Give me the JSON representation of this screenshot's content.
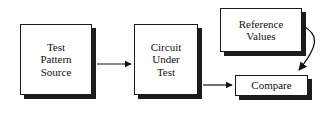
{
  "diagram": {
    "background_color": "#ffffff",
    "line_color": "#1a1a1a",
    "shadow_color": "#1c1c1c",
    "nodes": [
      {
        "id": "test-pattern-source",
        "label": "Test\nPattern\nSource",
        "shape": "rectangle",
        "has_shadow": true,
        "x": 20,
        "y": 24,
        "w": 72,
        "h": 71
      },
      {
        "id": "circuit-under-test",
        "label": "Circuit\nUnder\nTest",
        "shape": "rectangle",
        "has_shadow": true,
        "x": 134,
        "y": 24,
        "w": 64,
        "h": 71
      },
      {
        "id": "reference-values",
        "label": "Reference\nValues",
        "shape": "rectangle",
        "has_shadow": true,
        "x": 220,
        "y": 8,
        "w": 82,
        "h": 44
      },
      {
        "id": "compare",
        "label": "Compare",
        "shape": "rectangle",
        "has_shadow": true,
        "x": 235,
        "y": 75,
        "w": 73,
        "h": 21
      }
    ],
    "edges": [
      {
        "id": "tps-to-cut",
        "from": "test-pattern-source",
        "to": "circuit-under-test",
        "style": "straight",
        "arrowhead": "filled-triangle"
      },
      {
        "id": "cut-to-compare",
        "from": "circuit-under-test",
        "to": "compare",
        "style": "straight",
        "arrowhead": "filled-triangle"
      },
      {
        "id": "ref-to-compare",
        "from": "reference-values",
        "to": "compare",
        "style": "curved",
        "arrowhead": "filled-triangle"
      }
    ]
  }
}
